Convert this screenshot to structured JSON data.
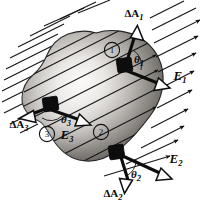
{
  "figure": {
    "background_color": "#ffffff",
    "width": 200,
    "height": 204,
    "surface": {
      "name": "closed-gaussian-surface",
      "outline_color": "#1a1a1a",
      "fill_light": "#f2f0ee",
      "fill_mid": "#9a9792",
      "fill_dark": "#3d3b39"
    },
    "field": {
      "line_color": "#111111",
      "arrowhead_style": "solid",
      "direction_degrees": -27,
      "label": "uniform electric field lines"
    }
  },
  "labels": {
    "area_1": "ΔA",
    "area_1_sub": "1",
    "area_2": "ΔA",
    "area_2_sub": "2",
    "area_3": "ΔA",
    "area_3_sub": "3",
    "field_1": "E",
    "field_1_sub": "1",
    "field_2": "E",
    "field_2_sub": "2",
    "field_3": "E",
    "field_3_sub": "3",
    "theta_1": "θ",
    "theta_1_sub": "1",
    "theta_2": "θ",
    "theta_2_sub": "2",
    "theta_3": "θ",
    "theta_3_sub": "3",
    "marker_1": "1",
    "marker_2": "2",
    "marker_3": "3"
  },
  "elements": [
    {
      "id": "element-1",
      "marker": "1",
      "patch_position": [
        124,
        66
      ],
      "area_vector_label": "ΔA1",
      "field_vector_label": "E1",
      "angle_label": "θ1",
      "area_vector_direction_degrees": 72,
      "field_vector_direction_degrees": -27
    },
    {
      "id": "element-2",
      "marker": "2",
      "patch_position": [
        116,
        152
      ],
      "area_vector_label": "ΔA2",
      "field_vector_label": "E2",
      "angle_label": "θ2",
      "area_vector_direction_degrees": -100,
      "field_vector_direction_degrees": -27
    },
    {
      "id": "element-3",
      "marker": "3",
      "patch_position": [
        50,
        104
      ],
      "area_vector_label": "ΔA3",
      "field_vector_label": "E3",
      "angle_label": "θ3",
      "area_vector_direction_degrees": 200,
      "field_vector_direction_degrees": -27
    }
  ]
}
